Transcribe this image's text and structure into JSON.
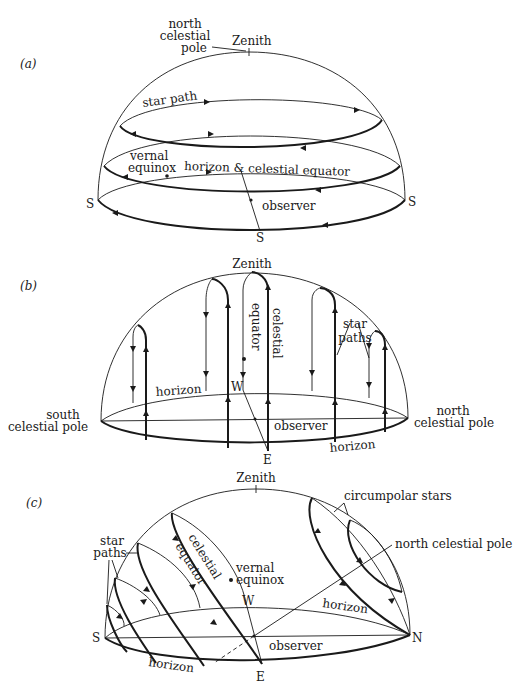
{
  "figure": {
    "panels": [
      {
        "id": "a",
        "label": "(a)",
        "labels": {
          "ncp": [
            "north",
            "celestial",
            "pole"
          ],
          "zenith": "Zenith",
          "star_path": "star path",
          "vernal": [
            "vernal",
            "equinox"
          ],
          "horizon_equator": "horizon & celestial equator",
          "observer": "observer",
          "s_left": "S",
          "s_right": "S",
          "s_bottom": "S"
        }
      },
      {
        "id": "b",
        "label": "(b)",
        "labels": {
          "zenith": "Zenith",
          "celestial_equator": [
            "celestial",
            "equator"
          ],
          "star_paths": [
            "star",
            "paths"
          ],
          "horizon_back": "horizon",
          "horizon_front": "horizon",
          "w": "W",
          "e": "E",
          "observer": "observer",
          "scp": [
            "south",
            "celestial pole"
          ],
          "ncp": [
            "north",
            "celestial pole"
          ]
        }
      },
      {
        "id": "c",
        "label": "(c)",
        "labels": {
          "zenith": "Zenith",
          "circumpolar": "circumpolar stars",
          "ncp": "north celestial pole",
          "star_paths": [
            "star",
            "paths"
          ],
          "celestial_equator": [
            "celestial",
            "equator"
          ],
          "vernal": [
            "vernal",
            "equinox"
          ],
          "w": "W",
          "e": "E",
          "s": "S",
          "n": "N",
          "horizon_back": "horizon",
          "horizon_front": "horizon",
          "observer": "observer"
        }
      }
    ]
  }
}
